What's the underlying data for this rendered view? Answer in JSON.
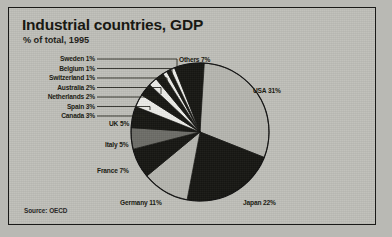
{
  "card": {
    "title": "Industrial countries, GDP",
    "subtitle": "% of total, 1995",
    "source": "Source: OECD"
  },
  "colors": {
    "paper": "#bfbfb9",
    "frame": "#1a1a18",
    "ink": "#15150f",
    "slice_light": "#b6b6b0",
    "slice_dark": "#171713",
    "slice_mid": "#6e6e68",
    "slice_white": "#ecece8",
    "leader": "#1f1f19"
  },
  "labels": {
    "sweden": "Sweden 1%",
    "belgium": "Belgium 1%",
    "switzerland": "Switzerland 1%",
    "australia": "Australia 2%",
    "netherlands": "Netherlands 2%",
    "spain": "Spain 3%",
    "canada": "Canada 3%",
    "uk": "UK 5%",
    "italy": "Italy 5%",
    "france": "France 7%",
    "germany": "Germany 11%",
    "japan": "Japan 22%",
    "usa": "USA 31%",
    "others": "Others 7%"
  },
  "chart_data": {
    "type": "pie",
    "title": "Industrial countries, GDP",
    "subtitle": "% of total, 1995",
    "unit": "% of total",
    "year": 1995,
    "source": "Source: OECD",
    "start_angle_deg": 0,
    "direction": "clockwise",
    "total": 100,
    "categories": [
      "USA",
      "Japan",
      "Germany",
      "France",
      "Italy",
      "UK",
      "Canada",
      "Spain",
      "Netherlands",
      "Australia",
      "Switzerland",
      "Belgium",
      "Sweden",
      "Others"
    ],
    "values": [
      31,
      22,
      11,
      7,
      5,
      5,
      3,
      3,
      2,
      2,
      1,
      1,
      1,
      7
    ],
    "slices": [
      {
        "name": "USA",
        "value": 31,
        "label": "USA 31%",
        "fill": "#b6b6b0",
        "label_side": "right"
      },
      {
        "name": "Japan",
        "value": 22,
        "label": "Japan 22%",
        "fill": "#171713",
        "label_side": "right"
      },
      {
        "name": "Germany",
        "value": 11,
        "label": "Germany 11%",
        "fill": "#b6b6b0",
        "label_side": "bottom"
      },
      {
        "name": "France",
        "value": 7,
        "label": "France 7%",
        "fill": "#171713",
        "label_side": "left"
      },
      {
        "name": "Italy",
        "value": 5,
        "label": "Italy 5%",
        "fill": "#6e6e68",
        "label_side": "left"
      },
      {
        "name": "UK",
        "value": 5,
        "label": "UK 5%",
        "fill": "#171713",
        "label_side": "left"
      },
      {
        "name": "Canada",
        "value": 3,
        "label": "Canada 3%",
        "fill": "#ecece8",
        "label_side": "left-leader"
      },
      {
        "name": "Spain",
        "value": 3,
        "label": "Spain 3%",
        "fill": "#171713",
        "label_side": "left-leader"
      },
      {
        "name": "Netherlands",
        "value": 2,
        "label": "Netherlands 2%",
        "fill": "#ecece8",
        "label_side": "left-leader"
      },
      {
        "name": "Australia",
        "value": 2,
        "label": "Australia 2%",
        "fill": "#171713",
        "label_side": "left-leader"
      },
      {
        "name": "Switzerland",
        "value": 1,
        "label": "Switzerland 1%",
        "fill": "#ecece8",
        "label_side": "left-leader"
      },
      {
        "name": "Belgium",
        "value": 1,
        "label": "Belgium 1%",
        "fill": "#171713",
        "label_side": "left-leader"
      },
      {
        "name": "Sweden",
        "value": 1,
        "label": "Sweden 1%",
        "fill": "#ecece8",
        "label_side": "left-leader"
      },
      {
        "name": "Others",
        "value": 7,
        "label": "Others 7%",
        "fill": "#171713",
        "label_side": "top"
      }
    ],
    "legend": "none",
    "grid": false
  }
}
